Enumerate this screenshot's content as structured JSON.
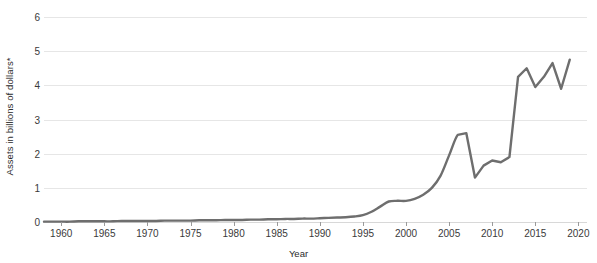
{
  "chart_data": {
    "type": "line",
    "title": "",
    "subtitle": "",
    "xlabel": "Year",
    "ylabel": "Assets in billions of dollars*",
    "xlim": [
      1958,
      2021
    ],
    "ylim": [
      0,
      6
    ],
    "grid": true,
    "legend": null,
    "legend_position": "none",
    "line_color": "#6e6e6e",
    "grid_color": "#e6e6e6",
    "y_ticks": [
      0,
      1,
      2,
      3,
      4,
      5,
      6
    ],
    "y_tick_labels": [
      "0",
      "1",
      "2",
      "3",
      "4",
      "5",
      "6"
    ],
    "x_ticks": [
      1960,
      1965,
      1970,
      1975,
      1980,
      1985,
      1990,
      1995,
      2000,
      2005,
      2010,
      2015,
      2020
    ],
    "x_tick_labels": [
      "1960",
      "1965",
      "1970",
      "1975",
      "1980",
      "1985",
      "1990",
      "1995",
      "2000",
      "2005",
      "2010",
      "2015",
      "2020"
    ],
    "series": [
      {
        "name": "Assets",
        "x": [
          1958,
          1959,
          1960,
          1961,
          1962,
          1963,
          1964,
          1965,
          1966,
          1967,
          1968,
          1969,
          1970,
          1971,
          1972,
          1973,
          1974,
          1975,
          1976,
          1977,
          1978,
          1979,
          1980,
          1981,
          1982,
          1983,
          1984,
          1985,
          1986,
          1987,
          1988,
          1989,
          1990,
          1991,
          1992,
          1993,
          1994,
          1995,
          1996,
          1997,
          1998,
          1999,
          2000,
          2001,
          2002,
          2003,
          2004,
          2005,
          2006,
          2007,
          2008,
          2009,
          2010,
          2011,
          2012,
          2013,
          2014,
          2015,
          2016,
          2017,
          2018,
          2019
        ],
        "values": [
          0.01,
          0.01,
          0.01,
          0.01,
          0.02,
          0.02,
          0.02,
          0.02,
          0.02,
          0.03,
          0.03,
          0.03,
          0.03,
          0.03,
          0.04,
          0.04,
          0.04,
          0.04,
          0.05,
          0.05,
          0.05,
          0.06,
          0.06,
          0.06,
          0.07,
          0.07,
          0.08,
          0.08,
          0.09,
          0.09,
          0.1,
          0.1,
          0.11,
          0.12,
          0.13,
          0.14,
          0.16,
          0.2,
          0.3,
          0.45,
          0.6,
          0.62,
          0.62,
          0.68,
          0.8,
          1.0,
          1.35,
          1.95,
          2.55,
          2.6,
          1.3,
          1.65,
          1.8,
          1.75,
          1.9,
          4.25,
          4.5,
          3.95,
          4.25,
          4.65,
          3.9,
          4.75
        ]
      }
    ]
  }
}
